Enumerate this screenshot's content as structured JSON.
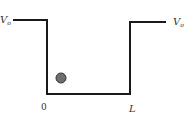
{
  "diagram": {
    "labels": {
      "left_potential": "V",
      "left_potential_sub": "o",
      "right_potential": "V",
      "right_potential_sub": "o",
      "origin": "0",
      "width": "L"
    },
    "colors": {
      "line": "#1a1a1a",
      "particle_fill": "#6e6e6e",
      "particle_stroke": "#333333"
    }
  }
}
